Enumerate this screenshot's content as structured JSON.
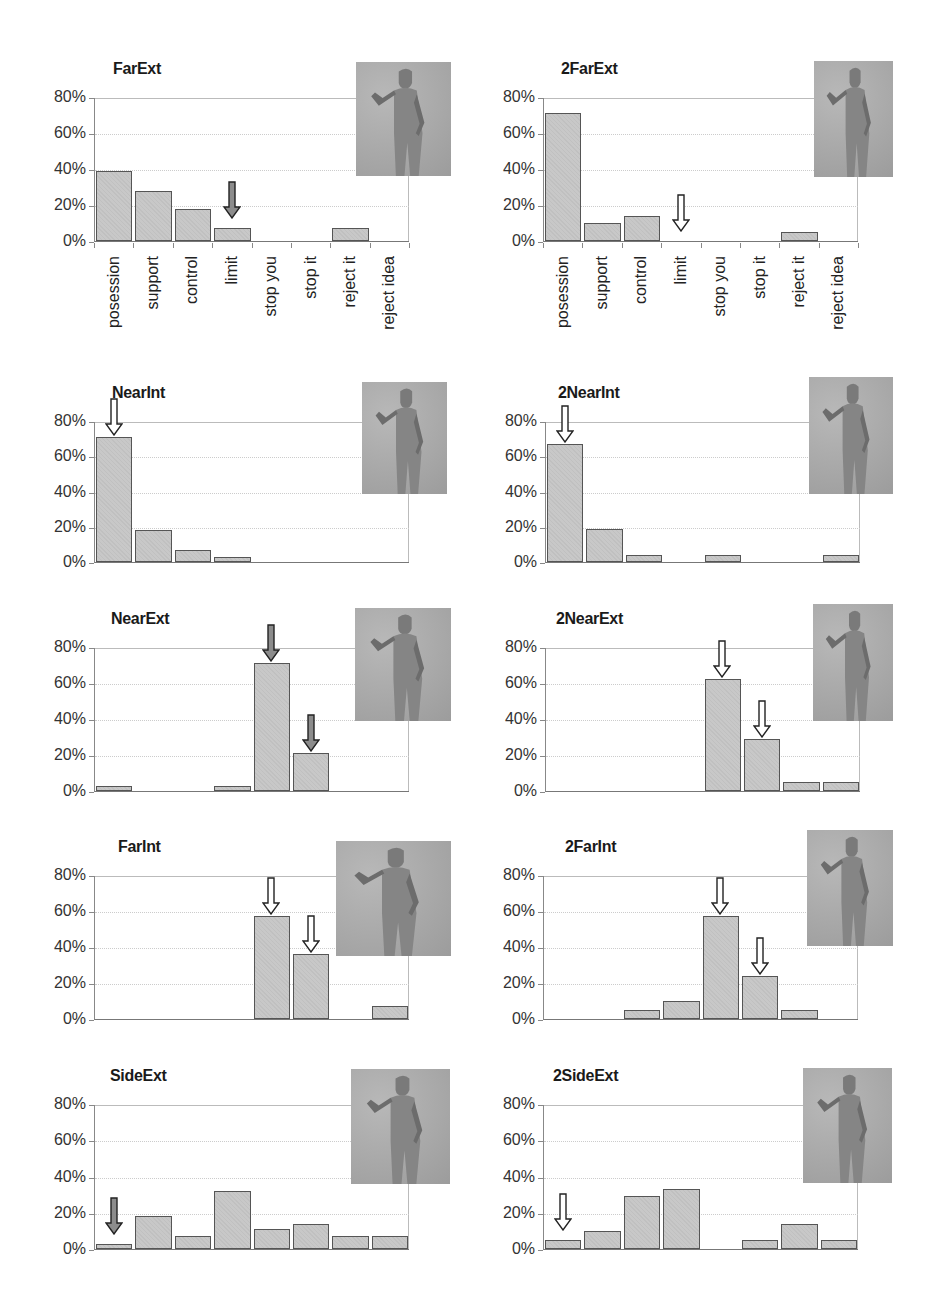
{
  "chart_data": [
    {
      "type": "bar",
      "title": "FarExt",
      "categories": [
        "posession",
        "support",
        "control",
        "limit",
        "stop you",
        "stop it",
        "reject it",
        "reject idea"
      ],
      "values": [
        39,
        28,
        18,
        7,
        0,
        0,
        7,
        0
      ],
      "yticks": [
        "0%",
        "20%",
        "40%",
        "60%",
        "80%"
      ],
      "ylim": [
        0,
        80
      ],
      "ylabel": "",
      "xlabel": "",
      "arrows": [
        {
          "category_index": 3,
          "style": "filled"
        }
      ],
      "show_xlabels": true,
      "grid": true
    },
    {
      "type": "bar",
      "title": "2FarExt",
      "categories": [
        "posession",
        "support",
        "control",
        "limit",
        "stop you",
        "stop it",
        "reject it",
        "reject idea"
      ],
      "values": [
        71,
        10,
        14,
        0,
        0,
        0,
        5,
        0
      ],
      "yticks": [
        "0%",
        "20%",
        "40%",
        "60%",
        "80%"
      ],
      "ylim": [
        0,
        80
      ],
      "ylabel": "",
      "xlabel": "",
      "arrows": [
        {
          "category_index": 3,
          "style": "hollow"
        }
      ],
      "show_xlabels": true,
      "grid": true
    },
    {
      "type": "bar",
      "title": "NearInt",
      "categories": [
        "posession",
        "support",
        "control",
        "limit",
        "stop you",
        "stop it",
        "reject it",
        "reject idea"
      ],
      "values": [
        71,
        18,
        7,
        3,
        0,
        0,
        0,
        0
      ],
      "yticks": [
        "0%",
        "20%",
        "40%",
        "60%",
        "80%"
      ],
      "ylim": [
        0,
        80
      ],
      "arrows": [
        {
          "category_index": 0,
          "style": "hollow"
        }
      ],
      "show_xlabels": false,
      "grid": true
    },
    {
      "type": "bar",
      "title": "2NearInt",
      "categories": [
        "posession",
        "support",
        "control",
        "limit",
        "stop you",
        "stop it",
        "reject it",
        "reject idea"
      ],
      "values": [
        67,
        19,
        4,
        0,
        4,
        0,
        0,
        4
      ],
      "yticks": [
        "0%",
        "20%",
        "40%",
        "60%",
        "80%"
      ],
      "ylim": [
        0,
        80
      ],
      "arrows": [
        {
          "category_index": 0,
          "style": "hollow"
        }
      ],
      "show_xlabels": false,
      "grid": true
    },
    {
      "type": "bar",
      "title": "NearExt",
      "categories": [
        "posession",
        "support",
        "control",
        "limit",
        "stop you",
        "stop it",
        "reject it",
        "reject idea"
      ],
      "values": [
        3,
        0,
        0,
        3,
        71,
        21,
        0,
        0
      ],
      "yticks": [
        "0%",
        "20%",
        "40%",
        "60%",
        "80%"
      ],
      "ylim": [
        0,
        80
      ],
      "arrows": [
        {
          "category_index": 4,
          "style": "filled"
        },
        {
          "category_index": 5,
          "style": "filled"
        }
      ],
      "show_xlabels": false,
      "grid": true
    },
    {
      "type": "bar",
      "title": "2NearExt",
      "categories": [
        "posession",
        "support",
        "control",
        "limit",
        "stop you",
        "stop it",
        "reject it",
        "reject idea"
      ],
      "values": [
        0,
        0,
        0,
        0,
        62,
        29,
        5,
        5
      ],
      "yticks": [
        "0%",
        "20%",
        "40%",
        "60%",
        "80%"
      ],
      "ylim": [
        0,
        80
      ],
      "arrows": [
        {
          "category_index": 4,
          "style": "hollow"
        },
        {
          "category_index": 5,
          "style": "hollow"
        }
      ],
      "show_xlabels": false,
      "grid": true
    },
    {
      "type": "bar",
      "title": "FarInt",
      "categories": [
        "posession",
        "support",
        "control",
        "limit",
        "stop you",
        "stop it",
        "reject it",
        "reject idea"
      ],
      "values": [
        0,
        0,
        0,
        0,
        57,
        36,
        0,
        7
      ],
      "yticks": [
        "0%",
        "20%",
        "40%",
        "60%",
        "80%"
      ],
      "ylim": [
        0,
        80
      ],
      "arrows": [
        {
          "category_index": 4,
          "style": "hollow"
        },
        {
          "category_index": 5,
          "style": "hollow"
        }
      ],
      "show_xlabels": false,
      "grid": true
    },
    {
      "type": "bar",
      "title": "2FarInt",
      "categories": [
        "posession",
        "support",
        "control",
        "limit",
        "stop you",
        "stop it",
        "reject it",
        "reject idea"
      ],
      "values": [
        0,
        0,
        5,
        10,
        57,
        24,
        5,
        0
      ],
      "yticks": [
        "0%",
        "20%",
        "40%",
        "60%",
        "80%"
      ],
      "ylim": [
        0,
        80
      ],
      "arrows": [
        {
          "category_index": 4,
          "style": "hollow"
        },
        {
          "category_index": 5,
          "style": "hollow"
        }
      ],
      "show_xlabels": false,
      "grid": true
    },
    {
      "type": "bar",
      "title": "SideExt",
      "categories": [
        "posession",
        "support",
        "control",
        "limit",
        "stop you",
        "stop it",
        "reject it",
        "reject idea"
      ],
      "values": [
        3,
        18,
        7,
        32,
        11,
        14,
        7,
        7
      ],
      "yticks": [
        "0%",
        "20%",
        "40%",
        "60%",
        "80%"
      ],
      "ylim": [
        0,
        80
      ],
      "arrows": [
        {
          "category_index": 0,
          "style": "filled"
        }
      ],
      "show_xlabels": false,
      "grid": true
    },
    {
      "type": "bar",
      "title": "2SideExt",
      "categories": [
        "posession",
        "support",
        "control",
        "limit",
        "stop you",
        "stop it",
        "reject it",
        "reject idea"
      ],
      "values": [
        5,
        10,
        29,
        33,
        0,
        5,
        14,
        5
      ],
      "yticks": [
        "0%",
        "20%",
        "40%",
        "60%",
        "80%"
      ],
      "ylim": [
        0,
        80
      ],
      "arrows": [
        {
          "category_index": 0,
          "style": "hollow"
        }
      ],
      "show_xlabels": false,
      "grid": true
    }
  ],
  "colors": {
    "bar_fill": "#c8c8c8",
    "bar_border": "#555555",
    "arrow_filled": "#8c8c8c",
    "arrow_hollow": "#ffffff",
    "figure_bg": "#a8a8a8"
  }
}
